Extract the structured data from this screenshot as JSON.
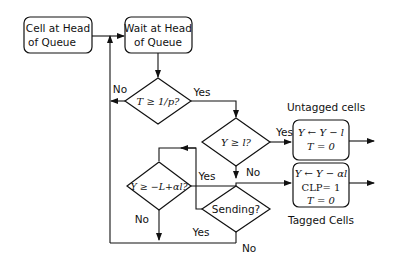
{
  "diagram": {
    "type": "flowchart",
    "nodes": {
      "cell_head": {
        "line1": "Cell at Head",
        "line2": "of Queue"
      },
      "wait_head": {
        "line1": "Wait at Head",
        "line2": "of Queue"
      },
      "decision_t": {
        "label": "T ≥ 1/p?",
        "yes": "Yes",
        "no": "No"
      },
      "decision_y": {
        "label": "Y ≥ l?",
        "yes": "Yes",
        "no": "No"
      },
      "decision_yl": {
        "label": "Y ≥ −L+αl?",
        "yes": "Yes",
        "no": "No"
      },
      "decision_sending": {
        "label": "Sending?",
        "yes": "Yes",
        "no": "No"
      },
      "untagged_box": {
        "line1": "Y ← Y − l",
        "line2": "T = 0"
      },
      "tagged_box": {
        "line1": "Y ← Y − αl",
        "line2": "CLP= 1",
        "line3": "T = 0"
      }
    },
    "annotations": {
      "untagged": "Untagged cells",
      "tagged": "Tagged Cells"
    }
  }
}
